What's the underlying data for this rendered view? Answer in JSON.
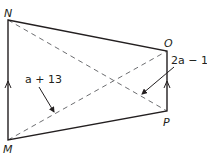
{
  "diagram": {
    "type": "trapezoid with diagonals",
    "vertices": [
      {
        "name": "N",
        "x": 8,
        "y": 20
      },
      {
        "name": "O",
        "x": 167,
        "y": 51
      },
      {
        "name": "P",
        "x": 167,
        "y": 111
      },
      {
        "name": "M",
        "x": 8,
        "y": 140
      }
    ],
    "labels": {
      "N": "N",
      "O": "O",
      "P": "P",
      "M": "M"
    },
    "expressions": {
      "diagonal_MO": "a + 13",
      "diagonal_NP": "2a − 1"
    },
    "parallel_marks": [
      "MN",
      "PO"
    ],
    "colors": {
      "stroke": "#231f20",
      "dashed": "#6d6e71"
    }
  }
}
